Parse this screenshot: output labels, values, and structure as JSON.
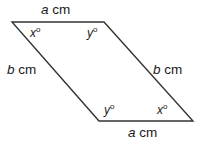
{
  "figure": {
    "type": "parallelogram-diagram",
    "background_color": "#ffffff",
    "stroke_color": "#333333",
    "text_color": "#1a1a1a",
    "stroke_width": 1.4,
    "vertices": {
      "top_left": {
        "x": 12,
        "y": 22
      },
      "top_right": {
        "x": 104,
        "y": 22
      },
      "bottom_right": {
        "x": 193,
        "y": 121
      },
      "bottom_left": {
        "x": 99,
        "y": 121
      }
    }
  },
  "labels": {
    "side_top": {
      "variable": "a",
      "unit": " cm"
    },
    "side_bottom": {
      "variable": "a",
      "unit": " cm"
    },
    "side_left": {
      "variable": "b",
      "unit": " cm"
    },
    "side_right": {
      "variable": "b",
      "unit": " cm"
    },
    "angle_top_left": {
      "variable": "x",
      "degree": "o"
    },
    "angle_top_right": {
      "variable": "y",
      "degree": "o"
    },
    "angle_bottom_left": {
      "variable": "y",
      "degree": "o"
    },
    "angle_bottom_right": {
      "variable": "x",
      "degree": "o"
    }
  }
}
